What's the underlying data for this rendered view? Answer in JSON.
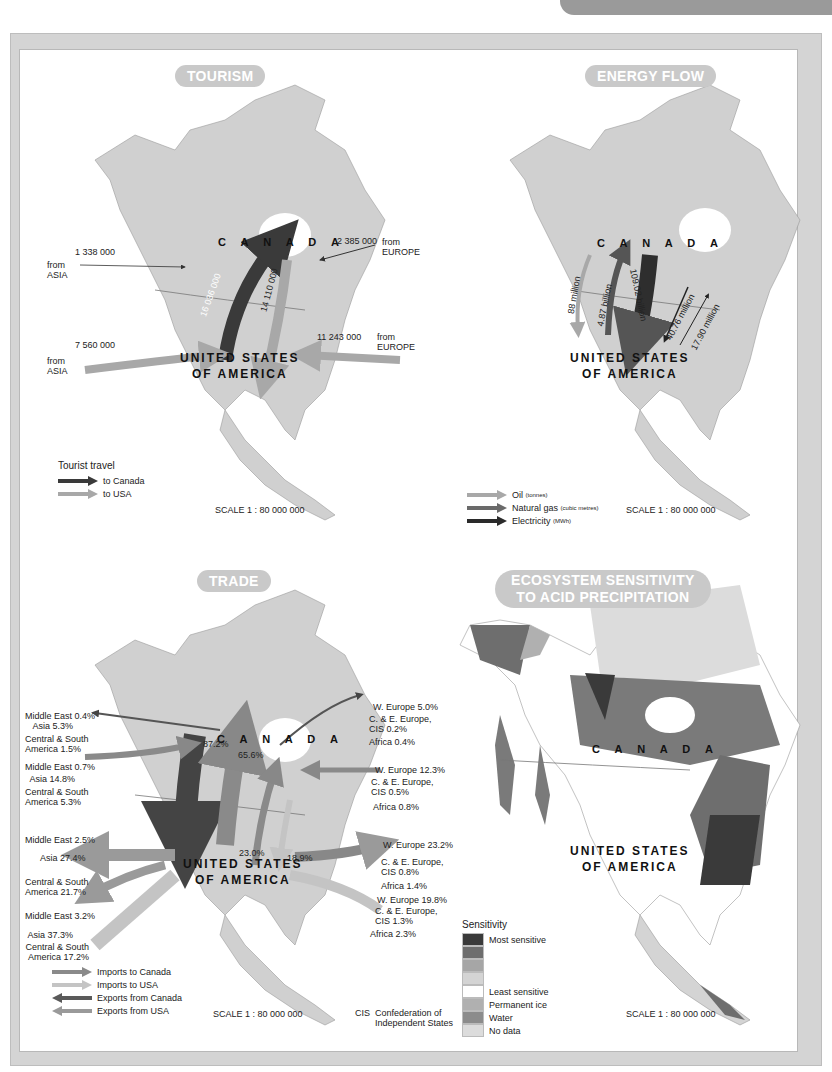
{
  "page": {
    "header_tab": ""
  },
  "tourism": {
    "title": "TOURISM",
    "canada_label": "C A N A D A",
    "usa_label_line1": "UNITED STATES",
    "usa_label_line2": "OF AMERICA",
    "flows": [
      {
        "value": "1 338 000",
        "from": "from",
        "origin": "ASIA",
        "to": "Canada"
      },
      {
        "value": "2 385 000",
        "from": "from",
        "origin": "EUROPE",
        "to": "Canada"
      },
      {
        "value": "7 560 000",
        "from": "from",
        "origin": "ASIA",
        "to": "USA"
      },
      {
        "value": "11 243 000",
        "from": "from",
        "origin": "EUROPE",
        "to": "USA"
      },
      {
        "value": "16 036 000",
        "direction": "USA to Canada"
      },
      {
        "value": "14 110 000",
        "direction": "Canada to USA"
      }
    ],
    "legend": {
      "title": "Tourist travel",
      "items": [
        {
          "label": "to Canada",
          "color": "#3a3a3a"
        },
        {
          "label": "to USA",
          "color": "#a8a8a8"
        }
      ]
    },
    "scale": "SCALE 1 : 80 000 000"
  },
  "energy": {
    "title": "ENERGY FLOW",
    "canada_label": "C A N A D A",
    "usa_label_line1": "UNITED STATES",
    "usa_label_line2": "OF AMERICA",
    "flows": [
      {
        "value": "88 million",
        "type": "Oil",
        "direction": "Canada to USA"
      },
      {
        "value": "4.87 billion",
        "type": "Natural gas",
        "direction": "USA to Canada"
      },
      {
        "value": "109.02 billion",
        "type": "Natural gas",
        "direction": "Canada to USA"
      },
      {
        "value": "40.76 million",
        "type": "Electricity",
        "direction": "Canada to USA"
      },
      {
        "value": "17.90 million",
        "type": "Electricity",
        "direction": "USA to Canada"
      }
    ],
    "legend": {
      "items": [
        {
          "label": "Oil",
          "unit": "(tonnes)",
          "color": "#a8a8a8"
        },
        {
          "label": "Natural gas",
          "unit": "(cubic metres)",
          "color": "#6a6a6a"
        },
        {
          "label": "Electricity",
          "unit": "(MWh)",
          "color": "#2a2a2a"
        }
      ]
    },
    "scale": "SCALE 1 : 80 000 000"
  },
  "trade": {
    "title": "TRADE",
    "canada_label": "C A N A D A",
    "usa_label_line1": "UNITED STATES",
    "usa_label_line2": "OF AMERICA",
    "bilateral": {
      "canada_to_usa": "87.2%",
      "usa_to_canada": "65.6%",
      "canada_imports_from_usa_side": "23.0%",
      "usa_side": "18.9%"
    },
    "west_labels": [
      {
        "text": "Middle East 0.4%"
      },
      {
        "text": "Asia 5.3%"
      },
      {
        "text": "Central & South",
        "text2": "America 1.5%"
      },
      {
        "text": "Middle East 0.7%"
      },
      {
        "text": "Asia 14.8%"
      },
      {
        "text": "Central & South",
        "text2": "America 5.3%"
      },
      {
        "text": "Middle East 2.5%"
      },
      {
        "text": "Asia 27.4%"
      },
      {
        "text": "Central & South",
        "text2": "America 21.7%"
      },
      {
        "text": "Middle East 3.2%"
      },
      {
        "text": "Asia 37.3%"
      },
      {
        "text": "Central & South",
        "text2": "America 17.2%"
      }
    ],
    "east_labels": [
      {
        "text": "W. Europe 5.0%"
      },
      {
        "text": "C. & E. Europe,",
        "text2": "CIS 0.2%"
      },
      {
        "text": "Africa 0.4%"
      },
      {
        "text": "W. Europe 12.3%"
      },
      {
        "text": "C. & E. Europe,",
        "text2": "CIS 0.5%"
      },
      {
        "text": "Africa 0.8%"
      },
      {
        "text": "W. Europe 23.2%"
      },
      {
        "text": "C. & E. Europe,",
        "text2": "CIS 0.8%"
      },
      {
        "text": "Africa 1.4%"
      },
      {
        "text": "W. Europe 19.8%"
      },
      {
        "text": "C. & E. Europe,",
        "text2": "CIS 1.3%"
      },
      {
        "text": "Africa 2.3%"
      }
    ],
    "legend": {
      "items": [
        {
          "label": "Imports to Canada",
          "color": "#8a8a8a"
        },
        {
          "label": "Imports to USA",
          "color": "#c4c4c4"
        },
        {
          "label": "Exports from Canada",
          "color": "#5a5a5a"
        },
        {
          "label": "Exports from USA",
          "color": "#9a9a9a"
        }
      ]
    },
    "scale": "SCALE 1 : 80 000 000",
    "footnote_abbr": "CIS",
    "footnote_line1": "Confederation of",
    "footnote_line2": "Independent States"
  },
  "ecosystem": {
    "title_line1": "ECOSYSTEM SENSITIVITY",
    "title_line2": "TO ACID PRECIPITATION",
    "canada_label": "C A N A D A",
    "usa_label_line1": "UNITED STATES",
    "usa_label_line2": "OF AMERICA",
    "legend": {
      "title": "Sensitivity",
      "items": [
        {
          "label": "Most sensitive",
          "color": "#3a3a3a"
        },
        {
          "label": "",
          "color": "#6e6e6e"
        },
        {
          "label": "",
          "color": "#a6a6a6"
        },
        {
          "label": "",
          "color": "#d4d4d4"
        },
        {
          "label": "Least sensitive",
          "color": "#ffffff"
        },
        {
          "label": "Permanent ice",
          "color": "#b0b0b0"
        },
        {
          "label": "Water",
          "color": "#8c8c8c"
        },
        {
          "label": "No data",
          "color": "#dcdcdc"
        }
      ]
    },
    "scale": "SCALE 1 : 80 000 000"
  }
}
